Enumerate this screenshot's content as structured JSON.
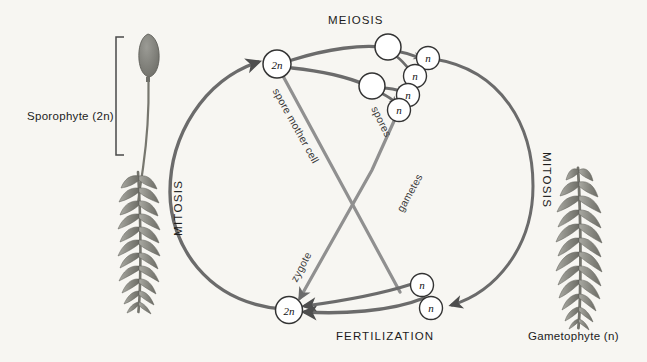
{
  "diagram": {
    "title_visible": false,
    "background_color": "#f7f6f2",
    "ink_color": "#4a4a4a",
    "plant_color": "#8c8c86"
  },
  "stage_labels": {
    "meiosis": "MEIOSIS",
    "fertilization": "FERTILIZATION",
    "mitosis_left": "MITOSIS",
    "mitosis_right": "MITOSIS"
  },
  "generation_labels": {
    "sporophyte": "Sporophyte (2n)",
    "gametophyte": "Gametophyte (n)"
  },
  "path_labels": {
    "spore_mother_cell": "spore mother cell",
    "spores": "spores",
    "gametes": "gametes",
    "zygote": "zygote"
  },
  "cells": {
    "sporophyte_2n": "2n",
    "zygote_2n": "2n",
    "meiosis_daughters": [
      "",
      ""
    ],
    "spores": [
      "n",
      "n",
      "n",
      "n"
    ],
    "gametes": [
      "n",
      "n"
    ]
  },
  "ploidy": {
    "diploid": "2n",
    "haploid": "n"
  }
}
